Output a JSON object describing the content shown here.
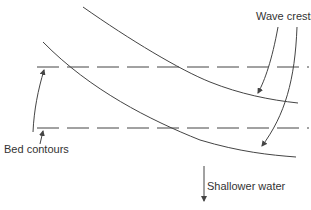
{
  "diagram": {
    "type": "wave refraction over bed contours",
    "labels": {
      "wave_crests": "Wave crests",
      "bed_contours": "Bed contours",
      "shallower_water": "Shallower water"
    },
    "elements": {
      "bed_contours": [
        "upper dashed contour",
        "lower dashed contour"
      ],
      "wave_crests": [
        "upper curved crest",
        "lower curved crest"
      ],
      "arrows": [
        "wave crests to upper crest",
        "wave crests to lower crest",
        "bed contours to upper contour",
        "bed contours to lower contour",
        "shallower water direction (downward)"
      ]
    },
    "colors": {
      "line": "#444444",
      "background": "#ffffff",
      "text": "#333333"
    }
  }
}
